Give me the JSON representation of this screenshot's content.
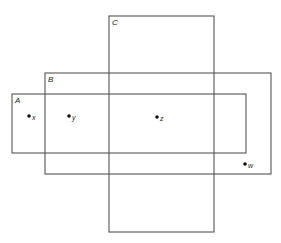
{
  "diagram": {
    "type": "overlapping-rectangles",
    "stroke_color": "#555555",
    "rectangles": [
      {
        "label": "A",
        "x": 12,
        "y": 94,
        "width": 234,
        "height": 59
      },
      {
        "label": "B",
        "x": 45,
        "y": 73,
        "width": 226,
        "height": 101
      },
      {
        "label": "C",
        "x": 109,
        "y": 16,
        "width": 105,
        "height": 216
      }
    ],
    "points": [
      {
        "label": "x",
        "cx": 29,
        "cy": 116
      },
      {
        "label": "y",
        "cx": 69,
        "cy": 116
      },
      {
        "label": "z",
        "cx": 157,
        "cy": 117
      },
      {
        "label": "w",
        "cx": 245,
        "cy": 164
      }
    ]
  }
}
